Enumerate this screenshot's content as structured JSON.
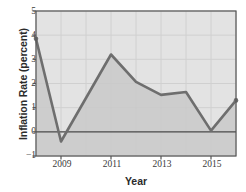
{
  "chart_data": {
    "type": "area",
    "title": "",
    "xlabel": "Year",
    "ylabel": "Inflation Rate (percent)",
    "x": [
      2008,
      2009,
      2010,
      2011,
      2012,
      2013,
      2014,
      2015,
      2016
    ],
    "values": [
      3.85,
      -0.4,
      1.4,
      3.2,
      2.07,
      1.53,
      1.65,
      0.05,
      1.3
    ],
    "series": [
      {
        "name": "Inflation Rate",
        "values": [
          3.85,
          -0.4,
          1.4,
          3.2,
          2.07,
          1.53,
          1.65,
          0.05,
          1.3
        ]
      }
    ],
    "xlim": [
      2008,
      2016
    ],
    "ylim": [
      -1,
      5
    ],
    "xticks": [
      2009,
      2011,
      2013,
      2015
    ],
    "xtick_labels": [
      "2009",
      "2011",
      "2013",
      "2015"
    ],
    "yticks": [
      -1,
      0,
      1,
      2,
      3,
      4,
      5
    ],
    "ytick_labels": [
      "−1",
      "0",
      "1",
      "2",
      "3",
      "4",
      "5"
    ],
    "grid": true,
    "legend": "none",
    "colors": {
      "line": "#6e6e6e",
      "fill": "#c9c9c9",
      "plot_background": "#e3e3e3",
      "grid": "#d0d0d0",
      "axis": "#555555",
      "zero_line": "#4a4a4a",
      "text": "#3a3a3a"
    }
  }
}
